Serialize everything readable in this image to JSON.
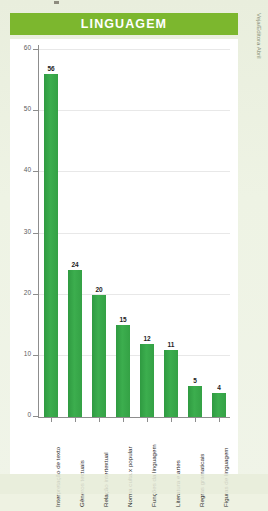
{
  "banner": {
    "title": "LINGUAGEM"
  },
  "credit": {
    "text": "Veja/Editora Abril"
  },
  "colors": {
    "banner_green": "#7cb72e",
    "bar_green": "#35a247",
    "page_background": "#eef2e2",
    "plot_background": "#ffffff",
    "axis": "#8d8d8d",
    "gridline": "#e8e8e8"
  },
  "chart_data": {
    "type": "bar",
    "title": "LINGUAGEM",
    "xlabel": "",
    "ylabel": "",
    "ylim": [
      0,
      60
    ],
    "yticks": [
      0,
      10,
      20,
      30,
      40,
      50,
      60
    ],
    "grid": true,
    "legend": "none",
    "categories": [
      "Interpretação de texto",
      "Gêneros textuais",
      "Relação intertextual",
      "Norma culta x popular",
      "Funções da linguagem",
      "Literatura e artes",
      "Regras gramaticais",
      "Figuras de linguagem"
    ],
    "values": [
      56,
      24,
      20,
      15,
      12,
      11,
      5,
      4
    ],
    "data_labels": [
      "56",
      "24",
      "20",
      "15",
      "12",
      "11",
      "5",
      "4"
    ]
  }
}
